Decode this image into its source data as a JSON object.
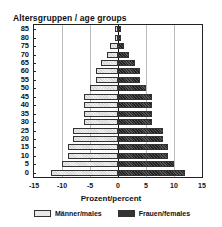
{
  "chart_data": {
    "type": "bar",
    "orientation": "horizontal",
    "subtype": "population-pyramid",
    "title": "Altersgruppen / age groups",
    "xlabel": "Prozent/percent",
    "ylabel": "Altersgruppen / age groups",
    "xlim": [
      -15,
      15
    ],
    "x_ticks": [
      "-15",
      "-10",
      "-5",
      "0",
      "5",
      "10",
      "15"
    ],
    "categories": [
      "0",
      "5",
      "10",
      "15",
      "20",
      "25",
      "30",
      "35",
      "40",
      "45",
      "50",
      "55",
      "60",
      "65",
      "70",
      "75",
      "80",
      "85"
    ],
    "series": [
      {
        "name": "Männer/males",
        "values": [
          -12,
          -10,
          -9,
          -9,
          -8,
          -8,
          -6,
          -6,
          -6,
          -6,
          -5,
          -4,
          -4,
          -3,
          -2,
          -1.5,
          -0.5,
          -0.5
        ],
        "color": "#e8e8e8"
      },
      {
        "name": "Frauen/females",
        "values": [
          12,
          10,
          9,
          9,
          8,
          8,
          6,
          6,
          6,
          6,
          5,
          4,
          4,
          3,
          2,
          1,
          0.5,
          0.5
        ],
        "color": "#333333"
      }
    ],
    "grid": {
      "vertical": true,
      "horizontal": false
    },
    "legend_position": "bottom"
  },
  "labels": {
    "title": "Altersgruppen / age groups",
    "xtitle": "Prozent/percent",
    "legend_male": "Männer/males",
    "legend_female": "Frauen/females"
  }
}
